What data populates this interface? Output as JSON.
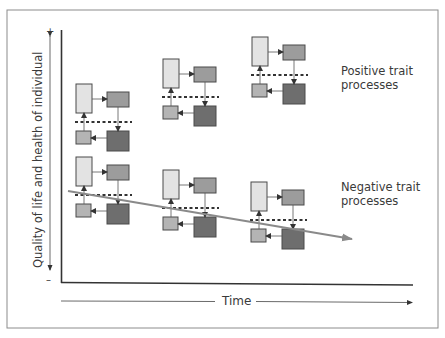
{
  "figure": {
    "y_axis": {
      "label": "Quality of life and health of individual",
      "plus_marker": "+",
      "minus_marker": "–"
    },
    "x_axis": {
      "label": "Time"
    },
    "labels": {
      "positive": "Positive trait processes",
      "positive_line1": "Positive trait",
      "positive_line2": "processes",
      "negative": "Negative trait processes",
      "negative_line1": "Negative trait",
      "negative_line2": "processes"
    },
    "colors": {
      "frame": "#8c8c8c",
      "axis": "#333333",
      "box_light": "#e3e3e3",
      "box_mid": "#9c9c9c",
      "box_small": "#b4b4b4",
      "box_dark": "#6e6e6e",
      "box_stroke": "#4a4a4a",
      "trend_arrow": "#8a8a8a",
      "dash": "#333333"
    },
    "groups": [
      {
        "name": "positive-1",
        "x": 76,
        "y": 84
      },
      {
        "name": "positive-2",
        "x": 163,
        "y": 59
      },
      {
        "name": "positive-3",
        "x": 252,
        "y": 37
      },
      {
        "name": "negative-1",
        "x": 76,
        "y": 157
      },
      {
        "name": "negative-2",
        "x": 163,
        "y": 170
      },
      {
        "name": "negative-3",
        "x": 251,
        "y": 182
      }
    ],
    "trend_arrow": {
      "x1": 68,
      "y1": 191,
      "x2": 352,
      "y2": 239
    }
  }
}
